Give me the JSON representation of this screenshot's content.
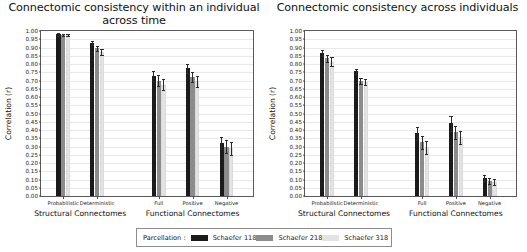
{
  "legend": {
    "title": "Parcellation :",
    "entries": [
      {
        "label": "Schaefer 118",
        "color": "#1b1b1b"
      },
      {
        "label": "Schaefer 218",
        "color": "#8c8c8c"
      },
      {
        "label": "Schaefer 318",
        "color": "#e3e3e3"
      }
    ]
  },
  "chart_data": [
    {
      "type": "bar",
      "title": "Connectomic consistency within an individual across time",
      "xlabel": "",
      "ylabel": "Correlation (r)",
      "ylim": [
        0.0,
        1.0
      ],
      "ytick_step": 0.05,
      "ytick_labels": [
        "0.00",
        "0.05",
        "0.10",
        "0.15",
        "0.20",
        "0.25",
        "0.30",
        "0.35",
        "0.40",
        "0.45",
        "0.50",
        "0.55",
        "0.60",
        "0.65",
        "0.70",
        "0.75",
        "0.80",
        "0.85",
        "0.90",
        "0.95",
        "1.00"
      ],
      "grid": true,
      "legend_position": "below-figure",
      "categories": [
        "Probabilistic",
        "Deterministic",
        "Full",
        "Positive",
        "Negative"
      ],
      "group_captions": [
        {
          "label": "Structural Connectomes",
          "categories": [
            "Probabilistic",
            "Deterministic"
          ]
        },
        {
          "label": "Functional Connectomes",
          "categories": [
            "Full",
            "Positive",
            "Negative"
          ]
        }
      ],
      "series": [
        {
          "name": "Schaefer 118",
          "color": "#1b1b1b",
          "values": [
            0.98,
            0.925,
            0.73,
            0.775,
            0.32
          ],
          "errors": [
            0.008,
            0.012,
            0.03,
            0.028,
            0.035
          ]
        },
        {
          "name": "Schaefer 218",
          "color": "#8c8c8c",
          "values": [
            0.975,
            0.895,
            0.7,
            0.72,
            0.3
          ],
          "errors": [
            0.008,
            0.015,
            0.033,
            0.032,
            0.038
          ]
        },
        {
          "name": "Schaefer 318",
          "color": "#e3e3e3",
          "values": [
            0.975,
            0.875,
            0.675,
            0.695,
            0.29
          ],
          "errors": [
            0.008,
            0.018,
            0.035,
            0.035,
            0.04
          ]
        }
      ]
    },
    {
      "type": "bar",
      "title": "Connectomic consistency across individuals",
      "xlabel": "",
      "ylabel": "Correlation (r)",
      "ylim": [
        0.0,
        1.0
      ],
      "ytick_step": 0.05,
      "ytick_labels": [
        "0.00",
        "0.05",
        "0.10",
        "0.15",
        "0.20",
        "0.25",
        "0.30",
        "0.35",
        "0.40",
        "0.45",
        "0.50",
        "0.55",
        "0.60",
        "0.65",
        "0.70",
        "0.75",
        "0.80",
        "0.85",
        "0.90",
        "0.95",
        "1.00"
      ],
      "grid": true,
      "legend_position": "below-figure",
      "categories": [
        "Probabilistic",
        "Deterministic",
        "Full",
        "Positive",
        "Negative"
      ],
      "group_captions": [
        {
          "label": "Structural Connectomes",
          "categories": [
            "Probabilistic",
            "Deterministic"
          ]
        },
        {
          "label": "Functional Connectomes",
          "categories": [
            "Full",
            "Positive",
            "Negative"
          ]
        }
      ],
      "series": [
        {
          "name": "Schaefer 118",
          "color": "#1b1b1b",
          "values": [
            0.865,
            0.755,
            0.38,
            0.44,
            0.11
          ],
          "errors": [
            0.018,
            0.015,
            0.04,
            0.045,
            0.02
          ]
        },
        {
          "name": "Schaefer 218",
          "color": "#8c8c8c",
          "values": [
            0.835,
            0.695,
            0.325,
            0.385,
            0.09
          ],
          "errors": [
            0.022,
            0.018,
            0.038,
            0.042,
            0.018
          ]
        },
        {
          "name": "Schaefer 318",
          "color": "#e3e3e3",
          "values": [
            0.815,
            0.69,
            0.295,
            0.355,
            0.085
          ],
          "errors": [
            0.028,
            0.02,
            0.038,
            0.04,
            0.018
          ]
        }
      ]
    }
  ]
}
